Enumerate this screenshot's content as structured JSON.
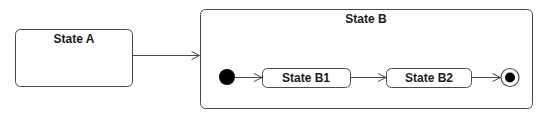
{
  "diagram": {
    "type": "uml-state-machine",
    "colors": {
      "stroke": "#4a4a4a",
      "fill": "#ffffff",
      "text": "#1a1a1a",
      "node_fill": "#000000"
    },
    "states": [
      {
        "id": "state-a",
        "label": "State A"
      },
      {
        "id": "state-b",
        "label": "State B",
        "composite": true,
        "substates": [
          {
            "id": "state-b1",
            "label": "State B1"
          },
          {
            "id": "state-b2",
            "label": "State B2"
          }
        ]
      }
    ],
    "pseudostates": [
      {
        "id": "initial",
        "kind": "initial",
        "parent": "state-b"
      },
      {
        "id": "final",
        "kind": "final",
        "parent": "state-b"
      }
    ],
    "transitions": [
      {
        "from": "state-a",
        "to": "state-b"
      },
      {
        "from": "initial",
        "to": "state-b1"
      },
      {
        "from": "state-b1",
        "to": "state-b2"
      },
      {
        "from": "state-b2",
        "to": "final"
      }
    ],
    "labels": {
      "state_a": "State A",
      "state_b": "State B",
      "state_b1": "State B1",
      "state_b2": "State B2"
    }
  }
}
